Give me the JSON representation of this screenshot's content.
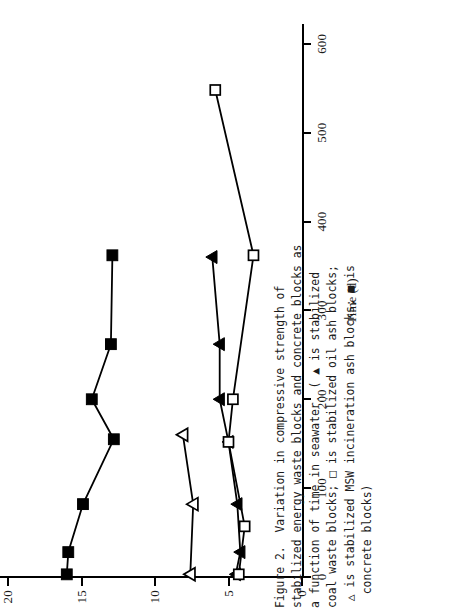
{
  "figure": {
    "caption_label": "Figure 2.",
    "caption_text": "Figure 2.  Variation in compressive strength of\nstabilized energy waste blocks and concrete blocks as\na function of time in seawater. ( ▲ is stabilized\ncoal waste blocks; □ is stabilized oil ash blocks;\n △ is stabilized MSW incineration ash blocks; ■ is\n  concrete blocks)"
  },
  "chart_data": {
    "type": "line",
    "title": "",
    "xlabel": "Time (d)",
    "ylabel": "",
    "xlim": [
      0,
      620
    ],
    "ylim": [
      0,
      20
    ],
    "xticks": [
      0,
      100,
      200,
      300,
      400,
      500,
      600
    ],
    "xticklabels": [
      "0",
      "100",
      "200",
      "300",
      "400",
      "500",
      "600"
    ],
    "yticks": [
      0,
      5,
      10,
      15,
      20
    ],
    "yticklabels": [
      "0",
      "5",
      "10",
      "15",
      "20"
    ],
    "grid": false,
    "legend": "in-caption",
    "series": [
      {
        "name": "concrete blocks",
        "marker": "filled-square",
        "color": "#000000",
        "points": [
          {
            "x": 3,
            "y": 16.0
          },
          {
            "x": 28,
            "y": 15.9
          },
          {
            "x": 82,
            "y": 14.9
          },
          {
            "x": 155,
            "y": 12.8
          },
          {
            "x": 200,
            "y": 14.3
          },
          {
            "x": 262,
            "y": 13.0
          },
          {
            "x": 362,
            "y": 12.9
          }
        ]
      },
      {
        "name": "stabilized MSW incineration ash blocks",
        "marker": "open-triangle",
        "color": "#000000",
        "points": [
          {
            "x": 3,
            "y": 7.6
          },
          {
            "x": 82,
            "y": 7.4
          },
          {
            "x": 160,
            "y": 8.1
          }
        ]
      },
      {
        "name": "stabilized coal waste blocks",
        "marker": "filled-triangle",
        "color": "#000000",
        "points": [
          {
            "x": 3,
            "y": 4.5
          },
          {
            "x": 28,
            "y": 4.2
          },
          {
            "x": 82,
            "y": 4.4
          },
          {
            "x": 152,
            "y": 5.0
          },
          {
            "x": 200,
            "y": 5.6
          },
          {
            "x": 262,
            "y": 5.6
          },
          {
            "x": 360,
            "y": 6.1
          }
        ]
      },
      {
        "name": "stabilized oil ash blocks",
        "marker": "open-square",
        "color": "#000000",
        "points": [
          {
            "x": 3,
            "y": 4.3
          },
          {
            "x": 57,
            "y": 3.9
          },
          {
            "x": 152,
            "y": 5.0
          },
          {
            "x": 200,
            "y": 4.7
          },
          {
            "x": 362,
            "y": 3.3
          },
          {
            "x": 548,
            "y": 5.9
          }
        ]
      }
    ]
  }
}
